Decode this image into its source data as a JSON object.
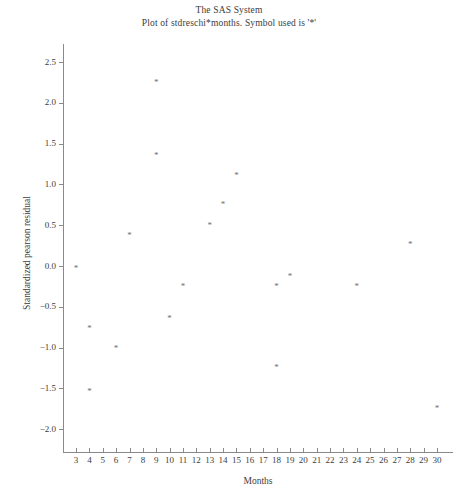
{
  "window": {
    "title_line_1": "The SAS System",
    "title_line_2": "Plot of stdreschi*months. Symbol used is '*'"
  },
  "chart_data": {
    "type": "scatter",
    "title": "The SAS System",
    "subtitle": "Plot of stdreschi*months. Symbol used is '*'",
    "xlabel": "Months",
    "ylabel": "Standardized pearson residual",
    "symbol": "*",
    "grid": false,
    "legend": null,
    "xlim": [
      2.3,
      30.7
    ],
    "ylim": [
      -2.25,
      2.75
    ],
    "xticks": [
      3,
      4,
      5,
      6,
      7,
      8,
      9,
      10,
      11,
      12,
      13,
      14,
      15,
      16,
      17,
      18,
      19,
      20,
      21,
      22,
      23,
      24,
      25,
      26,
      27,
      28,
      29,
      30
    ],
    "xtick_labels": [
      "3",
      "4",
      "5",
      "6",
      "7",
      "8",
      "9",
      "10",
      "11",
      "12",
      "13",
      "14",
      "15",
      "16",
      "17",
      "18",
      "19",
      "20",
      "21",
      "22",
      "23",
      "24",
      "25",
      "26",
      "27",
      "28",
      "29",
      "30"
    ],
    "yticks": [
      -2.0,
      -1.5,
      -1.0,
      -0.5,
      0.0,
      0.5,
      1.0,
      1.5,
      2.0,
      2.5
    ],
    "ytick_labels": [
      "-2.0",
      "-1.5",
      "-1.0",
      "-0.5",
      "0.0",
      "0.5",
      "1.0",
      "1.5",
      "2.0",
      "2.5"
    ],
    "points": [
      {
        "x": 3,
        "y": 0.0
      },
      {
        "x": 4,
        "y": -0.73
      },
      {
        "x": 4,
        "y": -1.51
      },
      {
        "x": 6,
        "y": -0.98
      },
      {
        "x": 7,
        "y": 0.4
      },
      {
        "x": 9,
        "y": 2.28
      },
      {
        "x": 9,
        "y": 1.39
      },
      {
        "x": 10,
        "y": -0.61
      },
      {
        "x": 11,
        "y": -0.22
      },
      {
        "x": 13,
        "y": 0.53
      },
      {
        "x": 14,
        "y": 0.78
      },
      {
        "x": 15,
        "y": 1.14
      },
      {
        "x": 18,
        "y": -0.22
      },
      {
        "x": 18,
        "y": -1.21
      },
      {
        "x": 19,
        "y": -0.1
      },
      {
        "x": 24,
        "y": -0.22
      },
      {
        "x": 28,
        "y": 0.3
      },
      {
        "x": 30,
        "y": -1.72
      }
    ]
  },
  "colors": {
    "axis": "#8a8a8a",
    "text": "#3c3c3c",
    "marker": "#6e6e73",
    "background": "#ffffff"
  }
}
